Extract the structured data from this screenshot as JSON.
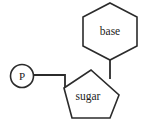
{
  "diagram": {
    "background_color": "#ffffff",
    "stroke_color": "#2b2b2b",
    "text_color": "#1c1c1c",
    "nodes": {
      "phosphate": {
        "label": "P",
        "shape": "circle",
        "center_x": 22,
        "center_y": 76,
        "radius": 11.5
      },
      "sugar": {
        "label": "sugar",
        "shape": "pentagon",
        "center_x": 91,
        "center_y": 97,
        "points": "64,88 91,70 119,95 110,118 72,118"
      },
      "base": {
        "label": "base",
        "shape": "hexagon",
        "center_x": 110,
        "center_y": 31,
        "points": "110,3 137,17 137,46 110,60 83,46 83,17"
      }
    },
    "bonds": [
      {
        "name": "phosphate-to-sugar",
        "from": "phosphate",
        "to": "sugar",
        "path": "M 34 75 L 65 75 L 65 89"
      },
      {
        "name": "base-to-sugar",
        "from": "base",
        "to": "sugar",
        "path": "M 110 60 L 110 79"
      }
    ]
  }
}
